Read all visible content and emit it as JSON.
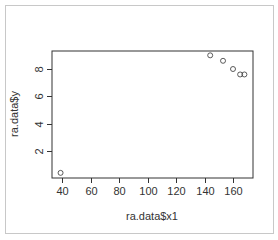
{
  "chart_data": {
    "type": "scatter",
    "title": "",
    "xlabel": "ra.data$x1",
    "ylabel": "ra.data$y",
    "xlim": [
      34,
      174
    ],
    "ylim": [
      0.1,
      9.3
    ],
    "xticks": [
      40,
      60,
      80,
      100,
      120,
      140,
      160
    ],
    "yticks": [
      2,
      4,
      6,
      8
    ],
    "grid": false,
    "legend": null,
    "marker": "open-circle",
    "series": [
      {
        "name": "ra.data",
        "points": [
          {
            "x": 39,
            "y": 0.4
          },
          {
            "x": 144,
            "y": 9.0
          },
          {
            "x": 153,
            "y": 8.6
          },
          {
            "x": 160,
            "y": 8.0
          },
          {
            "x": 165,
            "y": 7.6
          },
          {
            "x": 168,
            "y": 7.6
          }
        ]
      }
    ]
  },
  "colors": {
    "axis": "#333333",
    "marker": "#333333",
    "frame": "#c8c8c8"
  }
}
